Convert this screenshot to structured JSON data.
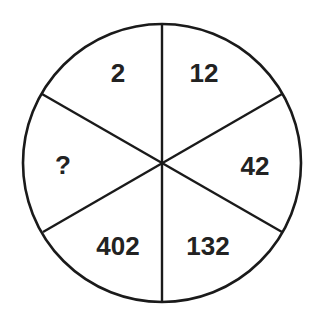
{
  "puzzle": {
    "type": "number-wheel",
    "segments": [
      {
        "position": "top-left",
        "value": "2"
      },
      {
        "position": "top-right",
        "value": "12"
      },
      {
        "position": "right",
        "value": "42"
      },
      {
        "position": "bottom-right",
        "value": "132"
      },
      {
        "position": "bottom-left",
        "value": "402"
      },
      {
        "position": "left",
        "value": "?"
      }
    ],
    "colors": {
      "stroke": "#1a1a1a",
      "text": "#222222",
      "background": "#ffffff"
    }
  }
}
